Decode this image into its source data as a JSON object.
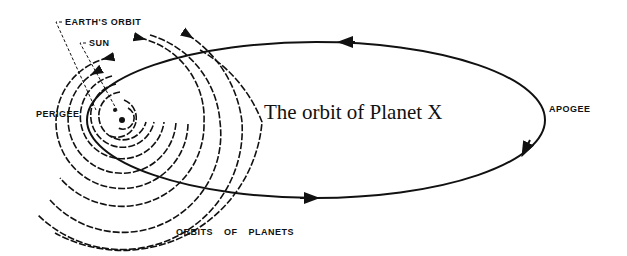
{
  "diagram": {
    "title": "The orbit of Planet X",
    "labels": {
      "earths_orbit": "EARTH'S ORBIT",
      "sun": "SUN",
      "perigee": "PERIGEE",
      "apogee": "APOGEE",
      "orbits_of_planets": "ORBITS OF PLANETS"
    },
    "colors": {
      "ink": "#111111",
      "background": "#ffffff"
    },
    "sun_center": [
      122,
      120
    ],
    "ellipse": {
      "cx": 316,
      "cy": 120,
      "rx": 229,
      "ry": 78
    }
  }
}
